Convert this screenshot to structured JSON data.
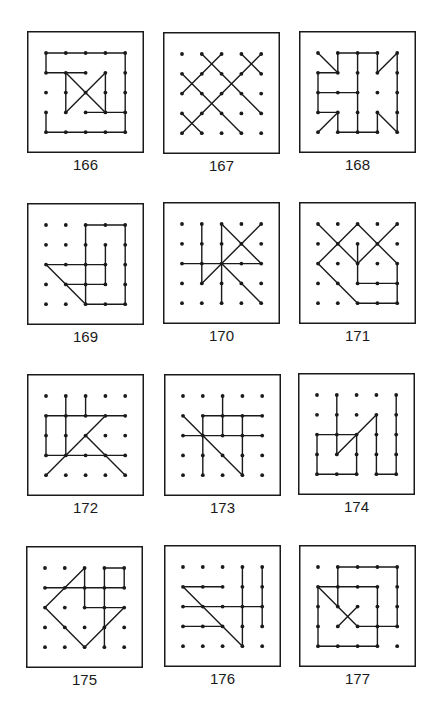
{
  "grid": {
    "cols": 5,
    "rows": 5,
    "ink_color": "#1a1a1a",
    "background": "#ffffff"
  },
  "puzzles": [
    {
      "number": "166",
      "segments": [
        [
          [
            0,
            0
          ],
          [
            4,
            0
          ]
        ],
        [
          [
            0,
            0
          ],
          [
            0,
            1
          ]
        ],
        [
          [
            0,
            1
          ],
          [
            2,
            1
          ]
        ],
        [
          [
            4,
            0
          ],
          [
            4,
            4
          ]
        ],
        [
          [
            0,
            3
          ],
          [
            0,
            4
          ]
        ],
        [
          [
            0,
            4
          ],
          [
            4,
            4
          ]
        ],
        [
          [
            1,
            1
          ],
          [
            3,
            3
          ]
        ],
        [
          [
            3,
            1
          ],
          [
            1,
            3
          ]
        ],
        [
          [
            1,
            1
          ],
          [
            1,
            3
          ]
        ],
        [
          [
            3,
            1
          ],
          [
            3,
            3
          ]
        ],
        [
          [
            2,
            3
          ],
          [
            4,
            3
          ]
        ]
      ]
    },
    {
      "number": "167",
      "segments": [
        [
          [
            2,
            0
          ],
          [
            0,
            2
          ]
        ],
        [
          [
            1,
            0
          ],
          [
            4,
            3
          ]
        ],
        [
          [
            3,
            0
          ],
          [
            4,
            1
          ]
        ],
        [
          [
            4,
            0
          ],
          [
            0,
            4
          ]
        ],
        [
          [
            0,
            1
          ],
          [
            3,
            4
          ]
        ],
        [
          [
            0,
            3
          ],
          [
            1,
            4
          ]
        ]
      ]
    },
    {
      "number": "168",
      "segments": [
        [
          [
            0,
            0
          ],
          [
            1,
            1
          ]
        ],
        [
          [
            1,
            1
          ],
          [
            0,
            1
          ]
        ],
        [
          [
            0,
            1
          ],
          [
            0,
            3
          ]
        ],
        [
          [
            0,
            3
          ],
          [
            1,
            3
          ]
        ],
        [
          [
            1,
            3
          ],
          [
            0,
            4
          ]
        ],
        [
          [
            1,
            1
          ],
          [
            1,
            0
          ]
        ],
        [
          [
            1,
            0
          ],
          [
            3,
            0
          ]
        ],
        [
          [
            3,
            0
          ],
          [
            3,
            1
          ]
        ],
        [
          [
            3,
            1
          ],
          [
            4,
            0
          ]
        ],
        [
          [
            4,
            0
          ],
          [
            4,
            4
          ]
        ],
        [
          [
            4,
            4
          ],
          [
            3,
            3
          ]
        ],
        [
          [
            3,
            3
          ],
          [
            3,
            4
          ]
        ],
        [
          [
            3,
            4
          ],
          [
            1,
            4
          ]
        ],
        [
          [
            1,
            4
          ],
          [
            1,
            3
          ]
        ],
        [
          [
            0,
            2
          ],
          [
            2,
            2
          ]
        ],
        [
          [
            2,
            0
          ],
          [
            2,
            4
          ]
        ]
      ]
    },
    {
      "number": "169",
      "segments": [
        [
          [
            2,
            0
          ],
          [
            4,
            0
          ]
        ],
        [
          [
            4,
            0
          ],
          [
            4,
            4
          ]
        ],
        [
          [
            4,
            4
          ],
          [
            2,
            4
          ]
        ],
        [
          [
            2,
            0
          ],
          [
            2,
            4
          ]
        ],
        [
          [
            3,
            1
          ],
          [
            3,
            3
          ]
        ],
        [
          [
            3,
            3
          ],
          [
            1,
            3
          ]
        ],
        [
          [
            0,
            2
          ],
          [
            3,
            2
          ]
        ],
        [
          [
            0,
            2
          ],
          [
            2,
            4
          ]
        ]
      ]
    },
    {
      "number": "170",
      "segments": [
        [
          [
            1,
            0
          ],
          [
            1,
            3
          ]
        ],
        [
          [
            1,
            3
          ],
          [
            4,
            0
          ]
        ],
        [
          [
            2,
            0
          ],
          [
            2,
            4
          ]
        ],
        [
          [
            2,
            0
          ],
          [
            4,
            2
          ]
        ],
        [
          [
            0,
            2
          ],
          [
            4,
            2
          ]
        ],
        [
          [
            2,
            2
          ],
          [
            4,
            4
          ]
        ]
      ]
    },
    {
      "number": "171",
      "segments": [
        [
          [
            0,
            0
          ],
          [
            2,
            2
          ]
        ],
        [
          [
            2,
            2
          ],
          [
            4,
            0
          ]
        ],
        [
          [
            1,
            1
          ],
          [
            2,
            0
          ]
        ],
        [
          [
            2,
            0
          ],
          [
            4,
            2
          ]
        ],
        [
          [
            1,
            1
          ],
          [
            0,
            2
          ]
        ],
        [
          [
            2,
            1
          ],
          [
            2,
            3
          ]
        ],
        [
          [
            2,
            3
          ],
          [
            4,
            3
          ]
        ],
        [
          [
            4,
            2
          ],
          [
            4,
            4
          ]
        ],
        [
          [
            4,
            4
          ],
          [
            2,
            4
          ]
        ],
        [
          [
            2,
            4
          ],
          [
            0,
            2
          ]
        ]
      ]
    },
    {
      "number": "172",
      "segments": [
        [
          [
            1,
            0
          ],
          [
            1,
            3
          ]
        ],
        [
          [
            2,
            0
          ],
          [
            2,
            1
          ]
        ],
        [
          [
            0,
            1
          ],
          [
            4,
            1
          ]
        ],
        [
          [
            0,
            1
          ],
          [
            0,
            3
          ]
        ],
        [
          [
            0,
            3
          ],
          [
            4,
            3
          ]
        ],
        [
          [
            3,
            1
          ],
          [
            0,
            4
          ]
        ],
        [
          [
            2,
            2
          ],
          [
            4,
            4
          ]
        ]
      ]
    },
    {
      "number": "173",
      "segments": [
        [
          [
            2,
            0
          ],
          [
            2,
            2
          ]
        ],
        [
          [
            1,
            1
          ],
          [
            4,
            1
          ]
        ],
        [
          [
            1,
            1
          ],
          [
            1,
            4
          ]
        ],
        [
          [
            0,
            2
          ],
          [
            4,
            2
          ]
        ],
        [
          [
            3,
            1
          ],
          [
            3,
            4
          ]
        ],
        [
          [
            0,
            1
          ],
          [
            3,
            4
          ]
        ]
      ]
    },
    {
      "number": "174",
      "segments": [
        [
          [
            1,
            0
          ],
          [
            1,
            3
          ]
        ],
        [
          [
            1,
            3
          ],
          [
            3,
            1
          ]
        ],
        [
          [
            0,
            2
          ],
          [
            2,
            2
          ]
        ],
        [
          [
            0,
            2
          ],
          [
            0,
            4
          ]
        ],
        [
          [
            0,
            4
          ],
          [
            2,
            4
          ]
        ],
        [
          [
            2,
            2
          ],
          [
            2,
            4
          ]
        ],
        [
          [
            3,
            1
          ],
          [
            3,
            4
          ]
        ],
        [
          [
            3,
            4
          ],
          [
            4,
            4
          ]
        ],
        [
          [
            4,
            0
          ],
          [
            4,
            4
          ]
        ]
      ]
    },
    {
      "number": "175",
      "segments": [
        [
          [
            3,
            0
          ],
          [
            4,
            0
          ]
        ],
        [
          [
            4,
            0
          ],
          [
            4,
            1
          ]
        ],
        [
          [
            0,
            1
          ],
          [
            4,
            1
          ]
        ],
        [
          [
            3,
            0
          ],
          [
            3,
            4
          ]
        ],
        [
          [
            2,
            0
          ],
          [
            2,
            2
          ]
        ],
        [
          [
            2,
            2
          ],
          [
            4,
            2
          ]
        ],
        [
          [
            2,
            0
          ],
          [
            0,
            2
          ]
        ],
        [
          [
            0,
            2
          ],
          [
            2,
            4
          ]
        ],
        [
          [
            2,
            4
          ],
          [
            4,
            2
          ]
        ]
      ]
    },
    {
      "number": "176",
      "segments": [
        [
          [
            0,
            1
          ],
          [
            2,
            1
          ]
        ],
        [
          [
            0,
            1
          ],
          [
            3,
            4
          ]
        ],
        [
          [
            0,
            2
          ],
          [
            4,
            2
          ]
        ],
        [
          [
            0,
            3
          ],
          [
            2,
            3
          ]
        ],
        [
          [
            3,
            0
          ],
          [
            3,
            4
          ]
        ],
        [
          [
            4,
            0
          ],
          [
            4,
            3
          ]
        ]
      ]
    },
    {
      "number": "177",
      "segments": [
        [
          [
            1,
            0
          ],
          [
            4,
            0
          ]
        ],
        [
          [
            4,
            0
          ],
          [
            4,
            3
          ]
        ],
        [
          [
            4,
            3
          ],
          [
            2,
            3
          ]
        ],
        [
          [
            2,
            3
          ],
          [
            0,
            1
          ]
        ],
        [
          [
            1,
            0
          ],
          [
            1,
            2
          ]
        ],
        [
          [
            0,
            1
          ],
          [
            3,
            1
          ]
        ],
        [
          [
            3,
            1
          ],
          [
            3,
            4
          ]
        ],
        [
          [
            0,
            1
          ],
          [
            0,
            4
          ]
        ],
        [
          [
            0,
            4
          ],
          [
            3,
            4
          ]
        ],
        [
          [
            2,
            2
          ],
          [
            1,
            3
          ]
        ]
      ]
    }
  ]
}
